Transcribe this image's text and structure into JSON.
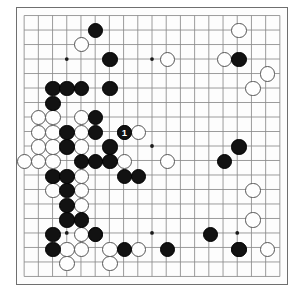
{
  "view": {
    "title": "Go board diagram",
    "board_size": 19,
    "board": {
      "line_color": "#8a8a8a",
      "border_color": "#6f6f6f",
      "background": "#fdfdfd",
      "black_color": "#121212",
      "white_color": "#fefefe"
    },
    "star_points": [
      [
        4,
        4
      ],
      [
        10,
        4
      ],
      [
        16,
        4
      ],
      [
        4,
        10
      ],
      [
        10,
        10
      ],
      [
        16,
        10
      ],
      [
        4,
        16
      ],
      [
        10,
        16
      ],
      [
        16,
        16
      ]
    ],
    "move_labels": [
      {
        "col": 8,
        "row": 9,
        "text": "1",
        "color": "black"
      }
    ],
    "black_stones": [
      [
        6,
        2
      ],
      [
        7,
        4
      ],
      [
        16,
        4
      ],
      [
        3,
        6
      ],
      [
        4,
        6
      ],
      [
        5,
        6
      ],
      [
        7,
        6
      ],
      [
        3,
        7
      ],
      [
        6,
        8
      ],
      [
        4,
        9
      ],
      [
        6,
        9
      ],
      [
        8,
        9
      ],
      [
        4,
        10
      ],
      [
        7,
        10
      ],
      [
        5,
        11
      ],
      [
        6,
        11
      ],
      [
        7,
        11
      ],
      [
        3,
        12
      ],
      [
        4,
        12
      ],
      [
        8,
        12
      ],
      [
        9,
        12
      ],
      [
        4,
        13
      ],
      [
        4,
        14
      ],
      [
        4,
        15
      ],
      [
        5,
        15
      ],
      [
        3,
        16
      ],
      [
        6,
        16
      ],
      [
        15,
        11
      ],
      [
        16,
        10
      ],
      [
        3,
        17
      ],
      [
        8,
        17
      ],
      [
        11,
        17
      ],
      [
        14,
        16
      ],
      [
        16,
        17
      ]
    ],
    "white_stones": [
      [
        5,
        3
      ],
      [
        16,
        2
      ],
      [
        11,
        4
      ],
      [
        15,
        4
      ],
      [
        18,
        5
      ],
      [
        17,
        6
      ],
      [
        2,
        8
      ],
      [
        3,
        8
      ],
      [
        5,
        8
      ],
      [
        2,
        9
      ],
      [
        3,
        9
      ],
      [
        5,
        9
      ],
      [
        8,
        9
      ],
      [
        9,
        9
      ],
      [
        2,
        10
      ],
      [
        3,
        10
      ],
      [
        5,
        10
      ],
      [
        1,
        11
      ],
      [
        2,
        11
      ],
      [
        3,
        11
      ],
      [
        5,
        12
      ],
      [
        8,
        11
      ],
      [
        11,
        11
      ],
      [
        3,
        13
      ],
      [
        5,
        13
      ],
      [
        5,
        14
      ],
      [
        5,
        16
      ],
      [
        6,
        16
      ],
      [
        4,
        17
      ],
      [
        5,
        17
      ],
      [
        7,
        17
      ],
      [
        9,
        17
      ],
      [
        17,
        13
      ],
      [
        17,
        15
      ],
      [
        16,
        17
      ],
      [
        18,
        17
      ],
      [
        4,
        18
      ],
      [
        7,
        18
      ]
    ]
  }
}
